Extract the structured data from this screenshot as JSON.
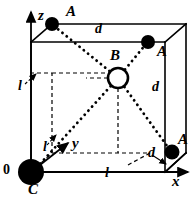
{
  "figure": {
    "width": 196,
    "height": 199,
    "background": "#ffffff",
    "stroke_color": "#000000"
  },
  "axes": {
    "z": {
      "label": "z",
      "x": 38,
      "y": 14
    },
    "y": {
      "label": "y",
      "x": 72,
      "y": 138
    },
    "x": {
      "label": "x",
      "x": 172,
      "y": 176
    }
  },
  "origin": {
    "label": "0",
    "x": 4,
    "y": 164
  },
  "atoms": [
    {
      "id": "A-top-back-left",
      "label": "A",
      "kind": "filled",
      "cx": 52,
      "cy": 24,
      "r": 7,
      "label_x": 66,
      "label_y": 9
    },
    {
      "id": "A-top-front-right",
      "label": "A",
      "kind": "filled",
      "cx": 148,
      "cy": 42,
      "r": 7,
      "label_x": 157,
      "label_y": 46
    },
    {
      "id": "A-bottom-right",
      "label": "A",
      "kind": "filled",
      "cx": 172,
      "cy": 152,
      "r": 7.5,
      "label_x": 178,
      "label_y": 134
    },
    {
      "id": "B-body-centre",
      "label": "B",
      "kind": "open",
      "cx": 118,
      "cy": 78,
      "r": 10,
      "label_x": 110,
      "label_y": 52
    },
    {
      "id": "C-origin",
      "label": "C",
      "kind": "filled",
      "cx": 31,
      "cy": 172,
      "r": 13,
      "label_x": 29,
      "label_y": 183
    }
  ],
  "dimension_labels": [
    {
      "id": "d-top",
      "label": "d",
      "x": 95,
      "y": 24
    },
    {
      "id": "d-right",
      "label": "d",
      "x": 152,
      "y": 82
    },
    {
      "id": "d-bottom-right",
      "label": "d",
      "x": 150,
      "y": 148
    },
    {
      "id": "l-left",
      "label": "l",
      "x": 19,
      "y": 81
    },
    {
      "id": "l-diagonal",
      "label": "l",
      "x": 44,
      "y": 142
    },
    {
      "id": "l-bottom",
      "label": "l",
      "x": 106,
      "y": 168
    }
  ],
  "geometry": {
    "front_face": {
      "x0": 31,
      "y0": 42,
      "x1": 165,
      "y1": 172
    },
    "back_face": {
      "x0": 52,
      "y0": 24,
      "x1": 186,
      "y1": 153
    },
    "depth_dx": 21,
    "depth_dy": -19
  },
  "styles": {
    "solid_edge_width": 1.6,
    "dashed_edge_width": 1.2,
    "dashed_pattern": "4,3",
    "dotted_bond_width": 2.6,
    "dotted_bond_pattern": "0.1,5.2",
    "axis_width": 1.8
  }
}
